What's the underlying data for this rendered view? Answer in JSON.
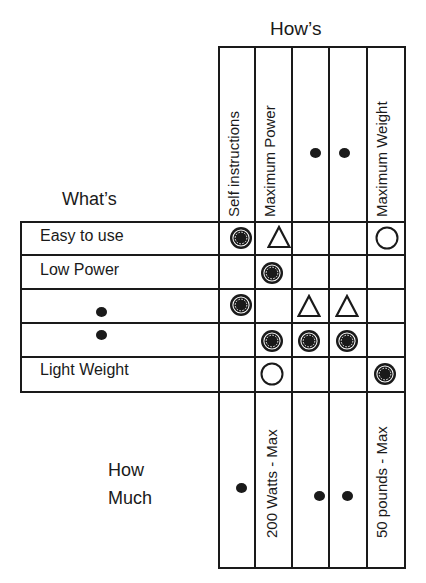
{
  "hows": {
    "title": "How’s",
    "columns": [
      {
        "label": "Self instructions",
        "how_much": "•"
      },
      {
        "label": "Maximum Power",
        "how_much": "200 Watts - Max"
      },
      {
        "label": "•",
        "how_much": "•"
      },
      {
        "label": "•",
        "how_much": "•"
      },
      {
        "label": "Maximum Weight",
        "how_much": "50 pounds - Max"
      }
    ]
  },
  "whats": {
    "title": "What’s",
    "rows": [
      {
        "label": "Easy to use",
        "cells": [
          "strong",
          "weak",
          "",
          "",
          "medium"
        ]
      },
      {
        "label": "Low Power",
        "cells": [
          "",
          "strong",
          "",
          "",
          ""
        ]
      },
      {
        "label": "•",
        "cells": [
          "strong",
          "",
          "weak",
          "weak",
          ""
        ]
      },
      {
        "label": "•",
        "cells": [
          "",
          "strong",
          "strong",
          "strong",
          ""
        ]
      },
      {
        "label": "Light Weight",
        "cells": [
          "",
          "medium",
          "",
          "",
          "strong"
        ]
      }
    ]
  },
  "how_much": {
    "title_line1": "How",
    "title_line2": "Much"
  },
  "legend_symbols": {
    "strong": "double-circle-filled",
    "medium": "open-circle",
    "weak": "open-triangle"
  }
}
